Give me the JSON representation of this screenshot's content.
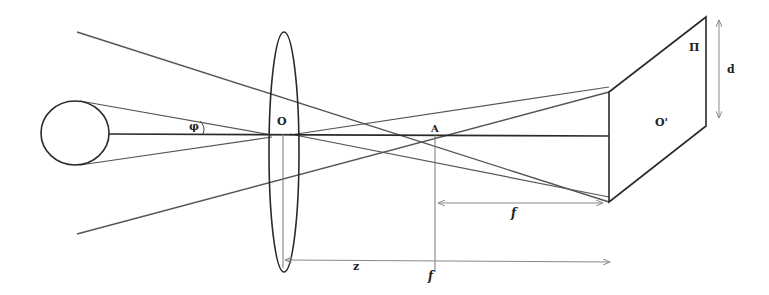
{
  "diagram": {
    "type": "optics-thin-lens-projection",
    "colors": {
      "background": "#ffffff",
      "stroke": "#2a2a2a",
      "ray": "#555555",
      "dimension": "#8a8a8a",
      "label": "#222222"
    },
    "labels": {
      "angle": "φ",
      "lens_center": "O",
      "focal_point": "A",
      "image_center": "O'",
      "image_plane": "Π",
      "image_size": "d",
      "focal_length_upper": "f",
      "object_distance": "z",
      "focal_length_lower": "f"
    },
    "elements": {
      "object": "circle",
      "lens": "ellipse",
      "image_plane": "parallelogram"
    }
  }
}
